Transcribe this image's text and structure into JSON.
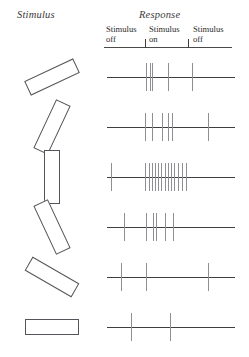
{
  "figure": {
    "stimulus_title": "Stimulus",
    "response_title": "Response"
  },
  "phases": [
    {
      "line1": "Stimulus",
      "line2": "off"
    },
    {
      "line1": "Stimulus",
      "line2": "on"
    },
    {
      "line1": "Stimulus",
      "line2": "off"
    }
  ],
  "chart_data": {
    "type": "raster",
    "title": "Response",
    "xlabel": "",
    "ylabel": "",
    "grid": false,
    "legend": null,
    "axis_note": "Time runs left to right; vertical ticks on the header rule mark stimulus onset and offset.",
    "stimulus_on_fraction": 0.32,
    "stimulus_off_fraction": 0.66,
    "series": [
      {
        "name": "trial-1",
        "bar_angle_deg": 25,
        "spike_count": 5,
        "spike_positions": [
          0.305,
          0.335,
          0.355,
          0.475,
          0.665
        ]
      },
      {
        "name": "trial-2",
        "bar_angle_deg": 65,
        "spike_count": 6,
        "spike_positions": [
          0.3,
          0.355,
          0.43,
          0.48,
          0.505,
          0.79
        ]
      },
      {
        "name": "trial-3",
        "bar_angle_deg": 90,
        "spike_count": 14,
        "spike_positions": [
          0.035,
          0.3,
          0.325,
          0.35,
          0.375,
          0.4,
          0.425,
          0.45,
          0.475,
          0.5,
          0.525,
          0.555,
          0.585,
          0.62
        ]
      },
      {
        "name": "trial-4",
        "bar_angle_deg": 115,
        "spike_count": 6,
        "spike_positions": [
          0.135,
          0.305,
          0.36,
          0.38,
          0.455,
          0.515
        ]
      },
      {
        "name": "trial-5",
        "bar_angle_deg": 150,
        "spike_count": 3,
        "spike_positions": [
          0.11,
          0.305,
          0.79
        ]
      },
      {
        "name": "trial-6",
        "bar_angle_deg": 0,
        "spike_count": 2,
        "spike_positions": [
          0.19,
          0.495
        ]
      }
    ]
  },
  "style": {
    "bar_stroke": "#55545a",
    "baseline_color": "#3f3f3f",
    "spike_color": "#8e8e93",
    "rule_color": "#4a4a4a"
  }
}
